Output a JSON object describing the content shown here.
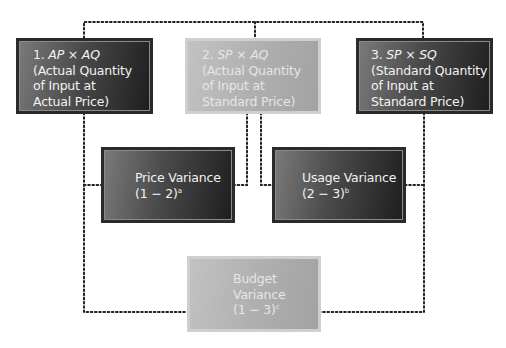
{
  "diagram": {
    "type": "variance-analysis-flow",
    "boxes": {
      "actual": {
        "number": "1.",
        "formula_a": "AP",
        "op": "×",
        "formula_b": "AQ",
        "line2": "(Actual Quantity",
        "line3": "of Input at",
        "line4": "Actual Price)"
      },
      "mixed": {
        "number": "2.",
        "formula_a": "SP",
        "op": "×",
        "formula_b": "AQ",
        "line2": "(Actual Quantity",
        "line3": "of Input at",
        "line4": "Standard Price)"
      },
      "standard": {
        "number": "3.",
        "formula_a": "SP",
        "op": "×",
        "formula_b": "SQ",
        "line2": "(Standard Quantity",
        "line3": "of Input at",
        "line4": "Standard Price)"
      },
      "price_variance": {
        "line1": "Price Variance",
        "line2": "(1 − 2)",
        "footnote": "a"
      },
      "usage_variance": {
        "line1": "Usage Variance",
        "line2": "(2 − 3)",
        "footnote": "b"
      },
      "budget_variance": {
        "line1": "Budget",
        "line2": "Variance",
        "line3": "(1 − 3)",
        "footnote": "c"
      }
    },
    "colors": {
      "dark_box_start": "#7a7a7a",
      "dark_box_end": "#1e1e1e",
      "light_box": "#b0b0b0",
      "connector": "#222222"
    }
  }
}
